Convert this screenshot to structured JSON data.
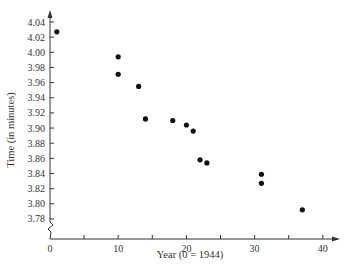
{
  "chart_data": {
    "type": "scatter",
    "title": "",
    "xlabel": "Year (0 = 1944)",
    "ylabel": "Time (in minutes)",
    "xlim": [
      0,
      42
    ],
    "ylim": [
      3.76,
      4.05
    ],
    "grid": false,
    "legend": null,
    "x_ticks": [
      0,
      10,
      20,
      30,
      40
    ],
    "x_minor_ticks": [
      5,
      15,
      25,
      35
    ],
    "y_ticks": [
      3.78,
      3.8,
      3.82,
      3.84,
      3.86,
      3.88,
      3.9,
      3.92,
      3.94,
      3.96,
      3.98,
      4.0,
      4.02,
      4.04
    ],
    "y_tick_labels": [
      "3.78",
      "3.80",
      "3.82",
      "3.84",
      "3.86",
      "3.88",
      "3.90",
      "3.92",
      "3.94",
      "3.96",
      "3.98",
      "4.00",
      "4.02",
      "4.04"
    ],
    "x_tick_labels": [
      "0",
      "10",
      "20",
      "30",
      "40"
    ],
    "y_axis_break": true,
    "points": [
      {
        "x": 1,
        "y": 4.027
      },
      {
        "x": 10,
        "y": 3.994
      },
      {
        "x": 10,
        "y": 3.971
      },
      {
        "x": 13,
        "y": 3.955
      },
      {
        "x": 14,
        "y": 3.912
      },
      {
        "x": 18,
        "y": 3.91
      },
      {
        "x": 20,
        "y": 3.904
      },
      {
        "x": 21,
        "y": 3.896
      },
      {
        "x": 22,
        "y": 3.858
      },
      {
        "x": 23,
        "y": 3.854
      },
      {
        "x": 31,
        "y": 3.839
      },
      {
        "x": 31,
        "y": 3.827
      },
      {
        "x": 37,
        "y": 3.792
      }
    ],
    "marker_color": "#111111"
  }
}
